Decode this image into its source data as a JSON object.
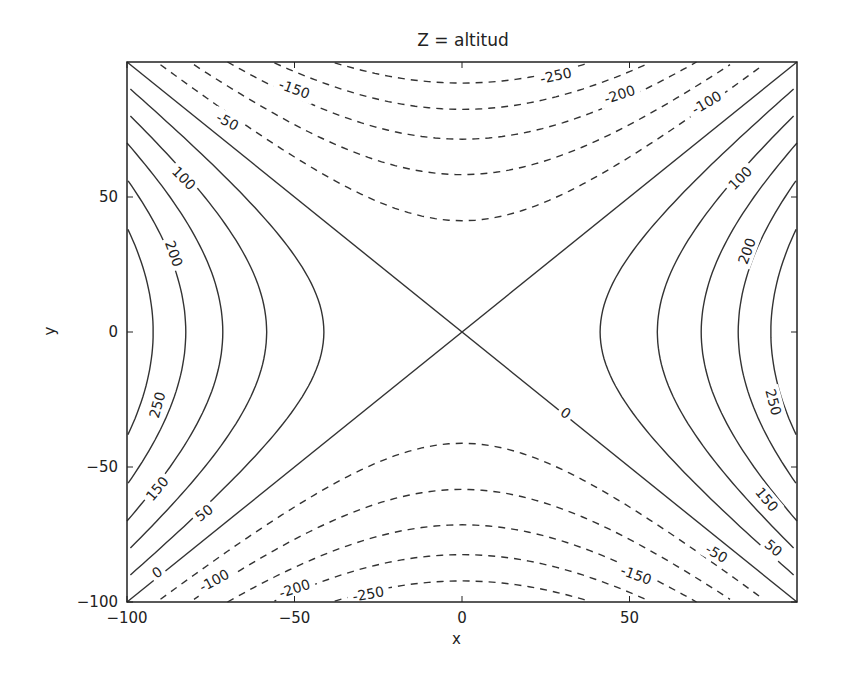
{
  "chart_data": {
    "type": "contour",
    "title": "Z = altitud",
    "xlabel": "x",
    "ylabel": "y",
    "xlim": [
      -100,
      100
    ],
    "ylim": [
      -100,
      100
    ],
    "grid": false,
    "function": "z = (x^2 - y^2) / 34",
    "levels": [
      -250,
      -200,
      -150,
      -100,
      -50,
      0,
      50,
      100,
      150,
      200,
      250
    ],
    "negative_linestyle": "dashed",
    "positive_linestyle": "solid",
    "line_color": "#333333",
    "x_ticks": [
      {
        "value": -100,
        "label": "−100"
      },
      {
        "value": -50,
        "label": "−50"
      },
      {
        "value": 0,
        "label": "0"
      },
      {
        "value": 50,
        "label": "50"
      }
    ],
    "y_ticks": [
      {
        "value": -100,
        "label": "−100"
      },
      {
        "value": -50,
        "label": "−50"
      },
      {
        "value": 0,
        "label": "0"
      },
      {
        "value": 50,
        "label": "50"
      }
    ],
    "contour_labels": [
      {
        "text": "-150",
        "x": -50,
        "y": 90,
        "rot": 20
      },
      {
        "text": "-50",
        "x": -70,
        "y": 78,
        "rot": 28
      },
      {
        "text": "-250",
        "x": 28,
        "y": 95,
        "rot": -12
      },
      {
        "text": "-200",
        "x": 47,
        "y": 88,
        "rot": -18
      },
      {
        "text": "-100",
        "x": 73,
        "y": 85,
        "rot": -30
      },
      {
        "text": "100",
        "x": -83,
        "y": 57,
        "rot": 45
      },
      {
        "text": "200",
        "x": -86,
        "y": 29,
        "rot": 70
      },
      {
        "text": "100",
        "x": 83,
        "y": 57,
        "rot": -45
      },
      {
        "text": "200",
        "x": 85,
        "y": 30,
        "rot": -70
      },
      {
        "text": "250",
        "x": -91,
        "y": -27,
        "rot": -75
      },
      {
        "text": "250",
        "x": 93,
        "y": -26,
        "rot": 75
      },
      {
        "text": "0",
        "x": 31,
        "y": -30,
        "rot": 35
      },
      {
        "text": "150",
        "x": -91,
        "y": -58,
        "rot": -50
      },
      {
        "text": "50",
        "x": -77,
        "y": -67,
        "rot": -38
      },
      {
        "text": "0",
        "x": -91,
        "y": -89,
        "rot": -35
      },
      {
        "text": "-100",
        "x": -74,
        "y": -92,
        "rot": -28
      },
      {
        "text": "-200",
        "x": -50,
        "y": -95,
        "rot": -18
      },
      {
        "text": "-250",
        "x": -28,
        "y": -97,
        "rot": -10
      },
      {
        "text": "-150",
        "x": 52,
        "y": -90,
        "rot": 20
      },
      {
        "text": "-50",
        "x": 76,
        "y": -82,
        "rot": 30
      },
      {
        "text": "150",
        "x": 91,
        "y": -62,
        "rot": 50
      },
      {
        "text": "50",
        "x": 93,
        "y": -80,
        "rot": 40
      }
    ]
  }
}
